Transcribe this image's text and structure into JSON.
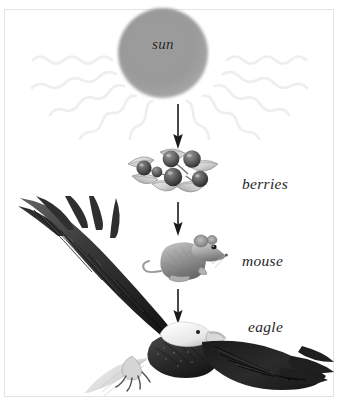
{
  "figure": {
    "background_color": "#ffffff",
    "frame_color": "#e4e4e6"
  },
  "sun": {
    "label": "sun",
    "disc_color": "#9b9b9b",
    "ray_color": "#f0f0f0",
    "ray_count": 10
  },
  "levels": [
    {
      "id": "berries",
      "label": "berries",
      "illustration": "berries-cluster-illustration"
    },
    {
      "id": "mouse",
      "label": "mouse",
      "illustration": "mouse-illustration"
    },
    {
      "id": "eagle",
      "label": "eagle",
      "illustration": "bald-eagle-illustration"
    }
  ],
  "arrows": [
    {
      "id": "sun-to-berries",
      "direction": "down",
      "color": "#1a1a1a"
    },
    {
      "id": "berries-to-mouse",
      "direction": "down",
      "color": "#1a1a1a"
    },
    {
      "id": "mouse-to-eagle",
      "direction": "down",
      "color": "#1a1a1a"
    }
  ],
  "palette": {
    "ink": "#1a1a1a",
    "label_text": "#262626",
    "sun_gray": "#9b9b9b",
    "ray_gray": "#f0f0f0",
    "frame": "#e4e4e6"
  }
}
